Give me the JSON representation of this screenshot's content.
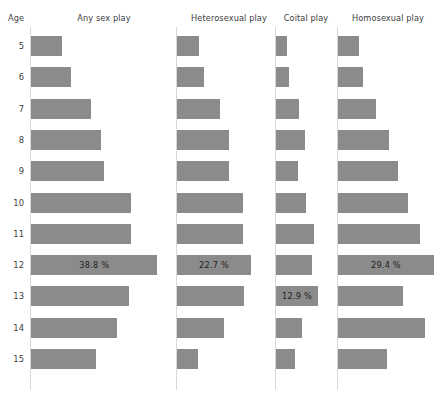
{
  "header": {
    "age_label": "Age",
    "columns": [
      {
        "label": "Any sex play"
      },
      {
        "label": "Heterosexual play"
      },
      {
        "label": "Coital play"
      },
      {
        "label": "Homosexual play"
      }
    ]
  },
  "chart_data": {
    "type": "bar",
    "title": "",
    "subtitle": "",
    "orientation": "horizontal",
    "xlabel": "",
    "ylabel": "Age",
    "grid": false,
    "legend": false,
    "axis_labels_shown": false,
    "xlim": [
      0,
      40
    ],
    "value_unit": "%",
    "categories": [
      "5",
      "6",
      "7",
      "8",
      "9",
      "10",
      "11",
      "12",
      "13",
      "14",
      "15"
    ],
    "series": [
      {
        "name": "Any sex play",
        "values": [
          9.5,
          12.3,
          18.5,
          21.5,
          22.5,
          30.8,
          30.8,
          38.8,
          30.2,
          26.5,
          20.0
        ],
        "labels": [
          "",
          "",
          "",
          "",
          "",
          "",
          "",
          "38.8 %",
          "",
          "",
          ""
        ]
      },
      {
        "name": "Heterosexual play",
        "values": [
          6.8,
          8.3,
          13.2,
          16.0,
          16.0,
          20.3,
          20.3,
          22.7,
          20.6,
          14.4,
          6.5
        ],
        "labels": [
          "",
          "",
          "",
          "",
          "",
          "",
          "",
          "22.7 %",
          "",
          "",
          ""
        ]
      },
      {
        "name": "Coital play",
        "values": [
          3.5,
          4.0,
          7.2,
          8.9,
          6.8,
          9.2,
          11.6,
          11.0,
          12.9,
          8.0,
          5.8
        ],
        "labels": [
          "",
          "",
          "",
          "",
          "",
          "",
          "",
          "",
          "12.9 %",
          "",
          ""
        ]
      },
      {
        "name": "Homosexual play",
        "values": [
          6.5,
          7.8,
          11.8,
          15.6,
          18.5,
          21.5,
          25.0,
          29.4,
          20.0,
          26.8,
          15.0
        ],
        "labels": [
          "",
          "",
          "",
          "",
          "",
          "",
          "",
          "29.4 %",
          "",
          "",
          ""
        ]
      }
    ],
    "colors": {
      "bar": "#8b8b8b",
      "axis": "#d8d8d8",
      "text": "#3d3d3d",
      "background": "#ffffff"
    }
  }
}
